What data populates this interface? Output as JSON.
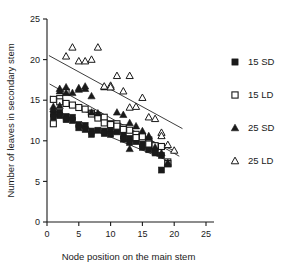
{
  "chart_data": {
    "type": "scatter",
    "title": "",
    "xlabel": "Node position on the main stem",
    "ylabel": "Number of leaves in secondary stem",
    "xlim": [
      0,
      25
    ],
    "ylim": [
      0,
      25
    ],
    "xticks": [
      0,
      5,
      10,
      15,
      20,
      25
    ],
    "yticks": [
      0,
      5,
      10,
      15,
      20,
      25
    ],
    "grid": false,
    "legend_position": "right",
    "series": [
      {
        "name": "15 SD",
        "marker": "filled-square",
        "color": "#1a1a1a",
        "points": [
          [
            1,
            13.3
          ],
          [
            1,
            12.9
          ],
          [
            2,
            13.5
          ],
          [
            2,
            13.1
          ],
          [
            3,
            13.0
          ],
          [
            3,
            12.6
          ],
          [
            4,
            12.9
          ],
          [
            4,
            12.5
          ],
          [
            5,
            12.0
          ],
          [
            5,
            11.6
          ],
          [
            6,
            11.9
          ],
          [
            6,
            11.4
          ],
          [
            7,
            11.2
          ],
          [
            7,
            10.8
          ],
          [
            8,
            11.3
          ],
          [
            9,
            11.2
          ],
          [
            9,
            10.9
          ],
          [
            10,
            11.2
          ],
          [
            10,
            10.8
          ],
          [
            11,
            11.1
          ],
          [
            12,
            10.6
          ],
          [
            12,
            10.2
          ],
          [
            13,
            10.3
          ],
          [
            13,
            9.8
          ],
          [
            14,
            9.9
          ],
          [
            15,
            9.6
          ],
          [
            15,
            9.2
          ],
          [
            16,
            9.4
          ],
          [
            16,
            8.9
          ],
          [
            17,
            8.8
          ],
          [
            17,
            8.5
          ],
          [
            18,
            8.2
          ],
          [
            18,
            6.4
          ]
        ],
        "fit_line": {
          "x": [
            0.6,
            19.5
          ],
          "y": [
            13.5,
            7.4
          ]
        }
      },
      {
        "name": "15 LD",
        "marker": "open-square",
        "color": "#1a1a1a",
        "points": [
          [
            1,
            15.1
          ],
          [
            1,
            12.1
          ],
          [
            2,
            15.2
          ],
          [
            2,
            14.8
          ],
          [
            3,
            16.0
          ],
          [
            3,
            14.6
          ],
          [
            4,
            14.4
          ],
          [
            5,
            14.1
          ],
          [
            6,
            13.9
          ],
          [
            7,
            13.4
          ],
          [
            7,
            13.3
          ],
          [
            8,
            13.1
          ],
          [
            8,
            12.8
          ],
          [
            9,
            12.9
          ],
          [
            9,
            12.2
          ],
          [
            10,
            12.1
          ],
          [
            10,
            12.0
          ],
          [
            11,
            12.1
          ],
          [
            11,
            11.8
          ],
          [
            12,
            11.6
          ],
          [
            12,
            11.4
          ],
          [
            13,
            11.3
          ],
          [
            14,
            10.8
          ],
          [
            14,
            10.4
          ],
          [
            15,
            10.5
          ],
          [
            16,
            10.1
          ],
          [
            16,
            9.6
          ],
          [
            17,
            9.4
          ],
          [
            18,
            9.3
          ],
          [
            19,
            7.4
          ],
          [
            19,
            7.2
          ]
        ],
        "fit_line": {
          "x": [
            0.5,
            20.5
          ],
          "y": [
            15.5,
            8.6
          ]
        }
      },
      {
        "name": "25 SD",
        "marker": "filled-triangle",
        "color": "#1a1a1a",
        "points": [
          [
            1,
            14.2
          ],
          [
            1,
            13.9
          ],
          [
            2,
            16.4
          ],
          [
            2,
            16.1
          ],
          [
            2,
            14.3
          ],
          [
            3,
            16.6
          ],
          [
            3,
            15.9
          ],
          [
            4,
            15.9
          ],
          [
            5,
            16.5
          ],
          [
            5,
            16.3
          ],
          [
            6,
            16.7
          ],
          [
            6,
            16.4
          ],
          [
            7,
            15.5
          ],
          [
            7,
            13.5
          ],
          [
            8,
            13.4
          ],
          [
            9,
            16.6
          ],
          [
            10,
            16.6
          ],
          [
            11,
            13.5
          ],
          [
            12,
            13.2
          ],
          [
            13,
            12.2
          ],
          [
            13,
            9.0
          ],
          [
            14,
            11.8
          ],
          [
            15,
            11.2
          ],
          [
            16,
            10.6
          ],
          [
            16,
            10.4
          ],
          [
            17,
            9.2
          ],
          [
            18,
            8.5
          ],
          [
            19,
            7.3
          ],
          [
            19,
            7.1
          ]
        ],
        "fit_line": {
          "x": [
            0.4,
            20.8
          ],
          "y": [
            17.0,
            8.1
          ]
        }
      },
      {
        "name": "25 LD",
        "marker": "open-triangle",
        "color": "#1a1a1a",
        "points": [
          [
            3,
            20.4
          ],
          [
            4,
            21.5
          ],
          [
            5,
            19.8
          ],
          [
            6,
            19.8
          ],
          [
            7,
            20.0
          ],
          [
            8,
            21.5
          ],
          [
            9,
            16.7
          ],
          [
            10,
            16.8
          ],
          [
            10,
            16.6
          ],
          [
            11,
            18.0
          ],
          [
            12,
            16.1
          ],
          [
            13,
            18.0
          ],
          [
            13,
            14.1
          ],
          [
            14,
            14.2
          ],
          [
            15,
            15.3
          ],
          [
            16,
            12.9
          ],
          [
            17,
            12.7
          ],
          [
            18,
            11.0
          ],
          [
            18,
            10.6
          ],
          [
            19,
            9.5
          ],
          [
            20,
            8.8
          ]
        ],
        "fit_line": {
          "x": [
            0.3,
            21.3
          ],
          "y": [
            20.5,
            11.5
          ]
        }
      }
    ]
  },
  "legend": {
    "entries": [
      {
        "label": "15 SD",
        "marker": "filled-square"
      },
      {
        "label": "15 LD",
        "marker": "open-square"
      },
      {
        "label": "25 SD",
        "marker": "filled-triangle"
      },
      {
        "label": "25 LD",
        "marker": "open-triangle"
      }
    ]
  }
}
